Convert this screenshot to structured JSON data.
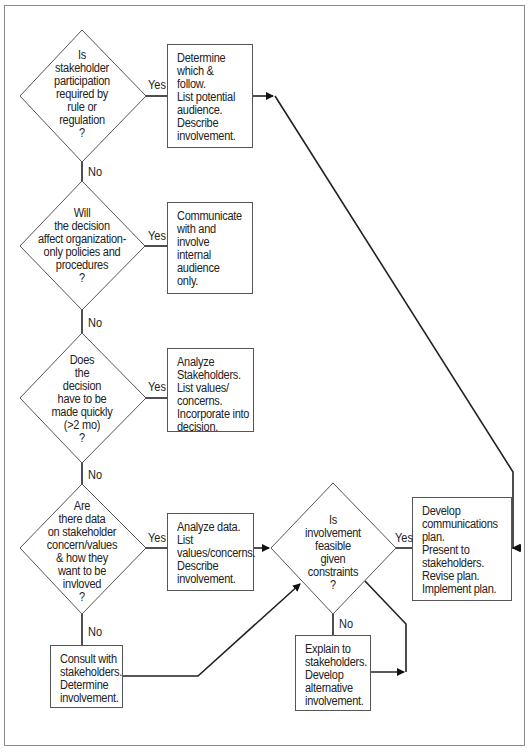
{
  "diagram": {
    "type": "flowchart",
    "decisions": [
      {
        "id": "d1",
        "lines": [
          "Is",
          "stakeholder",
          "participation",
          "required by",
          "rule or",
          "regulation",
          "?"
        ]
      },
      {
        "id": "d2",
        "lines": [
          "Will",
          "the decision",
          "affect organization-",
          "only policies and",
          "procedures",
          "?"
        ]
      },
      {
        "id": "d3",
        "lines": [
          "Does",
          "the",
          "decision",
          "have to be",
          "made quickly",
          "(>2 mo)",
          "?"
        ]
      },
      {
        "id": "d4",
        "lines": [
          "Are",
          "there data",
          "on stakeholder",
          "concern/values",
          "& how they",
          "want to be",
          "invloved",
          "?"
        ]
      },
      {
        "id": "d5",
        "lines": [
          "Is",
          "involvement",
          "feasible",
          "given",
          "constraints",
          "?"
        ]
      }
    ],
    "actions": [
      {
        "id": "a1",
        "lines": [
          "Determine",
          "which &",
          "follow.",
          "List potential",
          "audience.",
          "Describe",
          "involvement."
        ]
      },
      {
        "id": "a2",
        "lines": [
          "Communicate",
          "with and",
          "involve",
          "internal",
          "audience",
          "only."
        ]
      },
      {
        "id": "a3",
        "lines": [
          "Analyze",
          "Stakeholders.",
          "List values/",
          "concerns.",
          "Incorporate into",
          "decision."
        ]
      },
      {
        "id": "a4",
        "lines": [
          "Analyze data.",
          "List",
          "values/concerns.",
          "Describe",
          "involvement."
        ]
      },
      {
        "id": "a5",
        "lines": [
          "Consult with",
          "stakeholders.",
          "Determine",
          "involvement."
        ]
      },
      {
        "id": "a6",
        "lines": [
          "Explain to",
          "stakeholders.",
          "Develop",
          "alternative",
          "involvement."
        ]
      },
      {
        "id": "a7",
        "lines": [
          "Develop",
          "communications",
          "plan.",
          "Present to",
          "stakeholders.",
          "Revise plan.",
          "Implement plan."
        ]
      }
    ],
    "edge_labels": {
      "yes": "Yes",
      "no": "No"
    },
    "edges": [
      {
        "from": "d1",
        "to": "a1",
        "label": "Yes"
      },
      {
        "from": "d1",
        "to": "d2",
        "label": "No"
      },
      {
        "from": "d2",
        "to": "a2",
        "label": "Yes"
      },
      {
        "from": "d2",
        "to": "d3",
        "label": "No"
      },
      {
        "from": "d3",
        "to": "a3",
        "label": "Yes"
      },
      {
        "from": "d3",
        "to": "d4",
        "label": "No"
      },
      {
        "from": "d4",
        "to": "a4",
        "label": "Yes"
      },
      {
        "from": "d4",
        "to": "a5",
        "label": "No"
      },
      {
        "from": "a4",
        "to": "d5",
        "label": ""
      },
      {
        "from": "a5",
        "to": "d5",
        "label": ""
      },
      {
        "from": "d5",
        "to": "a7",
        "label": "Yes"
      },
      {
        "from": "d5",
        "to": "a6",
        "label": "No"
      },
      {
        "from": "a6",
        "to": "d5-return",
        "label": ""
      },
      {
        "from": "a1",
        "to": "a7",
        "label": ""
      }
    ],
    "colors": {
      "line": "#222222",
      "frame": "#8a8a8a",
      "background": "#ffffff"
    }
  }
}
